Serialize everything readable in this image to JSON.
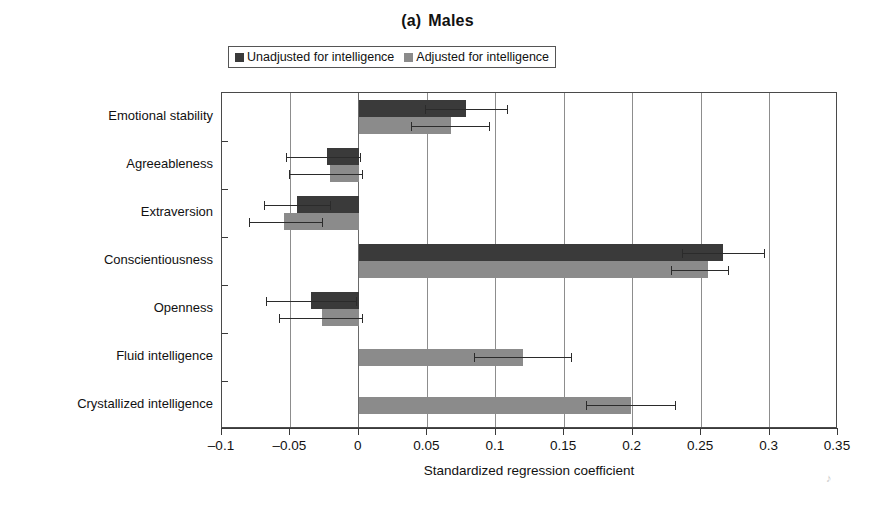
{
  "figure": {
    "title_number": "(a)",
    "title_text": "Males"
  },
  "legend": {
    "items": [
      {
        "label": "Unadjusted for intelligence",
        "color": "#3a3a3a",
        "key": "unadjusted"
      },
      {
        "label": "Adjusted for intelligence",
        "color": "#8b8b8b",
        "key": "adjusted"
      }
    ]
  },
  "axes": {
    "xlabel": "Standardized regression coefficient",
    "xticklabels": [
      "-0.1",
      "-0.05",
      "0",
      "0.05",
      "0.1",
      "0.15",
      "0.2",
      "0.25",
      "0.3",
      "0.35"
    ],
    "ylabel": ""
  },
  "chart_data": {
    "type": "bar",
    "orientation": "horizontal",
    "xlabel": "Standardized regression coefficient",
    "ylabel": "",
    "xlim": [
      -0.1,
      0.35
    ],
    "xticks": [
      -0.1,
      -0.05,
      0,
      0.05,
      0.1,
      0.15,
      0.2,
      0.25,
      0.3,
      0.35
    ],
    "grid": "vertical",
    "legend_position": "top-center",
    "categories": [
      "Emotional stability",
      "Agreeableness",
      "Extraversion",
      "Conscientiousness",
      "Openness",
      "Fluid intelligence",
      "Crystallized intelligence"
    ],
    "series": [
      {
        "name": "Unadjusted for intelligence",
        "color": "#3a3a3a",
        "values": [
          0.078,
          -0.023,
          -0.045,
          0.266,
          -0.035,
          null,
          null
        ],
        "err_low": [
          0.048,
          -0.053,
          -0.069,
          0.236,
          -0.068,
          null,
          null
        ],
        "err_high": [
          0.108,
          0.001,
          -0.021,
          0.296,
          -0.002,
          null,
          null
        ]
      },
      {
        "name": "Adjusted for intelligence",
        "color": "#8b8b8b",
        "values": [
          0.067,
          -0.021,
          -0.055,
          0.255,
          -0.027,
          0.12,
          0.199
        ],
        "err_low": [
          0.038,
          -0.051,
          -0.08,
          0.228,
          -0.058,
          0.084,
          0.166
        ],
        "err_high": [
          0.095,
          0.002,
          -0.027,
          0.27,
          0.002,
          0.155,
          0.231
        ]
      }
    ]
  }
}
